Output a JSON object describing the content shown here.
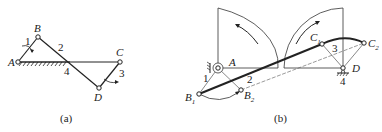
{
  "figure_a": {
    "caption": "(a)",
    "points": {
      "A": "A",
      "B": "B",
      "C": "C",
      "D": "D"
    },
    "links": {
      "l1": "1",
      "l2": "2",
      "l3": "3",
      "l4": "4"
    }
  },
  "figure_b": {
    "caption": "(b)",
    "points": {
      "A": "A",
      "B1": "B",
      "B1_sub": "1",
      "B2": "B",
      "B2_sub": "2",
      "C1": "C",
      "C1_sub": "1",
      "C2": "C",
      "C2_sub": "2",
      "D": "D"
    },
    "links": {
      "l1": "1",
      "l2": "2",
      "l3": "3",
      "l4": "4"
    }
  },
  "colors": {
    "line": "#222222",
    "thin": "#555555"
  }
}
